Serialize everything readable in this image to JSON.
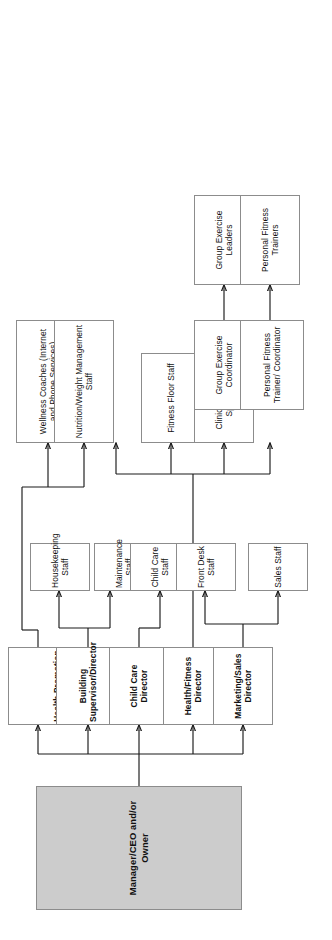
{
  "chart_title": "Health/Fitness Club Organizational Chart",
  "colors": {
    "root_fill": "#cccccc",
    "box_fill": "#ffffff",
    "box_border": "#8c8c8c",
    "connector": "#1a1a1a",
    "text": "#111111"
  },
  "root": {
    "id": "root",
    "label": "Manager/CEO and/or Owner",
    "bold": true,
    "filled": true
  },
  "directors": [
    {
      "id": "marketing-sales-director",
      "label": "Marketing/Sales Director",
      "bold": true
    },
    {
      "id": "health-fitness-director",
      "label": "Health/Fitness Director",
      "bold": true
    },
    {
      "id": "child-care-director",
      "label": "Child Care Director",
      "bold": true
    },
    {
      "id": "building-supervisor-director",
      "label": "Building Supervisor/Director",
      "bold": true
    },
    {
      "id": "health-promotion-wellness-director",
      "label": "Health Promotion or Wellness Director",
      "bold": true
    }
  ],
  "staff": [
    {
      "id": "sales-staff",
      "label": "Sales Staff",
      "parent": "marketing-sales-director"
    },
    {
      "id": "front-desk-staff",
      "label": "Front Desk Staff",
      "parent": "marketing-sales-director"
    },
    {
      "id": "child-care-staff",
      "label": "Child Care Staff",
      "parent": "child-care-director"
    },
    {
      "id": "maintenance-staff",
      "label": "Maintenance Staff",
      "parent": "building-supervisor-director"
    },
    {
      "id": "housekeeping-staff",
      "label": "Housekeeping Staff",
      "parent": "building-supervisor-director"
    }
  ],
  "specialists": [
    {
      "id": "personal-fitness-trainer-coordinator",
      "label": "Personal Fitness Trainer/ Coordinator",
      "parent": "health-fitness-director"
    },
    {
      "id": "group-exercise-coordinator",
      "label": "Group Exercise Coordinator",
      "parent": "health-fitness-director"
    },
    {
      "id": "clinical-exercise-specialist",
      "label": "Clinical Exercise Specialist",
      "parent": "health-fitness-director"
    },
    {
      "id": "fitness-floor-staff",
      "label": "Fitness Floor Staff",
      "parent": "health-fitness-director"
    },
    {
      "id": "nutrition-weight-management-staff",
      "label": "Nutrition/Weight Management Staff",
      "parent": "health-promotion-wellness-director"
    },
    {
      "id": "wellness-coaches",
      "label": "Wellness Coaches (Internet and Phone Services)",
      "parent": "health-promotion-wellness-director"
    }
  ],
  "leaves": [
    {
      "id": "personal-fitness-trainers",
      "label": "Personal Fitness Trainers",
      "parent": "personal-fitness-trainer-coordinator"
    },
    {
      "id": "group-exercise-leaders",
      "label": "Group Exercise Leaders",
      "parent": "group-exercise-coordinator"
    }
  ]
}
